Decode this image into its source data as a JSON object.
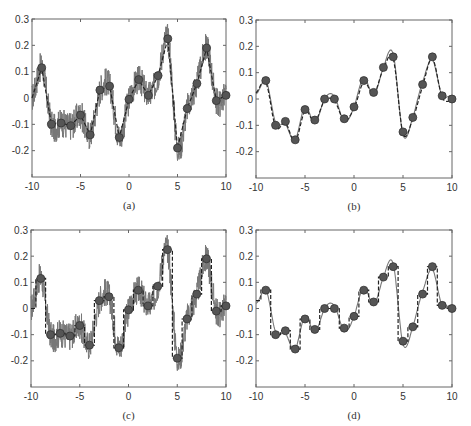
{
  "figure": {
    "captions": [
      "(a)",
      "(b)",
      "(c)",
      "(d)"
    ],
    "colors": {
      "axis": "#666666",
      "signal": "#777777",
      "dashed": "#222222",
      "marker_fill": "#555555",
      "marker_edge": "#333333",
      "text": "#333333"
    }
  },
  "chart_data": [
    {
      "id": "a",
      "type": "line",
      "caption": "(a)",
      "xlim": [
        -10,
        10
      ],
      "ylim": [
        -0.3,
        0.3
      ],
      "xticks": [
        -10,
        -5,
        0,
        5,
        10
      ],
      "yticks": [
        0.3,
        0.2,
        0.1,
        0,
        -0.1,
        -0.2
      ],
      "ytick_labels": [
        "0.3",
        "0.2",
        "0.1",
        "0",
        "-0.1",
        "-0.2"
      ],
      "xtick_labels": [
        "-10",
        "-5",
        "0",
        "5",
        "10"
      ],
      "grid": false,
      "series": [
        {
          "name": "noisy signal",
          "style": "solid gray, high-frequency noise"
        },
        {
          "name": "piecewise-linear interpolant",
          "style": "dashed black",
          "x": [
            -10,
            -9,
            -8,
            -7,
            -6,
            -5,
            -4,
            -3,
            -2,
            -1,
            0,
            1,
            2,
            3,
            4,
            5,
            6,
            7,
            8,
            9,
            10
          ],
          "y": [
            0.0,
            0.115,
            -0.1,
            -0.095,
            -0.105,
            -0.065,
            -0.14,
            0.03,
            0.045,
            -0.15,
            -0.005,
            0.07,
            0.01,
            0.085,
            0.225,
            -0.19,
            -0.04,
            0.055,
            0.19,
            -0.01,
            0.01
          ]
        },
        {
          "name": "samples",
          "style": "filled circles",
          "x": [
            -9,
            -8,
            -7,
            -6,
            -5,
            -4,
            -3,
            -2,
            -1,
            0,
            1,
            2,
            3,
            4,
            5,
            6,
            7,
            8,
            9,
            10
          ],
          "y": [
            0.115,
            -0.1,
            -0.095,
            -0.105,
            -0.065,
            -0.14,
            0.03,
            0.045,
            -0.15,
            -0.005,
            0.07,
            0.01,
            0.085,
            0.225,
            -0.19,
            -0.04,
            0.055,
            0.19,
            -0.01,
            0.01
          ]
        }
      ]
    },
    {
      "id": "b",
      "type": "line",
      "caption": "(b)",
      "xlim": [
        -10,
        10
      ],
      "ylim": [
        -0.3,
        0.3
      ],
      "xticks": [
        -10,
        -5,
        0,
        5,
        10
      ],
      "yticks": [
        0.3,
        0.2,
        0.1,
        0,
        -0.1,
        -0.2
      ],
      "ytick_labels": [
        "0.3",
        "0.2",
        "0.1",
        "0",
        "-0.1",
        "-0.2"
      ],
      "xtick_labels": [
        "-10",
        "-5",
        "0",
        "5",
        "10"
      ],
      "grid": false,
      "series": [
        {
          "name": "smooth signal",
          "style": "solid gray"
        },
        {
          "name": "smooth interpolant",
          "style": "dashed black"
        },
        {
          "name": "samples",
          "style": "filled circles",
          "x": [
            -9,
            -8,
            -7,
            -6,
            -5,
            -4,
            -3,
            -2,
            -1,
            0,
            1,
            2,
            3,
            4,
            5,
            6,
            7,
            8,
            9,
            10
          ],
          "y": [
            0.07,
            -0.1,
            -0.085,
            -0.155,
            -0.04,
            -0.08,
            0.0,
            0.0,
            -0.075,
            -0.03,
            0.07,
            0.025,
            0.12,
            0.16,
            -0.125,
            -0.07,
            0.055,
            0.16,
            0.012,
            0.0
          ]
        }
      ]
    },
    {
      "id": "c",
      "type": "line",
      "caption": "(c)",
      "xlim": [
        -10,
        10
      ],
      "ylim": [
        -0.3,
        0.3
      ],
      "xticks": [
        -10,
        -5,
        0,
        5,
        10
      ],
      "yticks": [
        0.3,
        0.2,
        0.1,
        0,
        -0.1,
        -0.2
      ],
      "ytick_labels": [
        "0.3",
        "0.2",
        "0.1",
        "0",
        "-0.1",
        "-0.2"
      ],
      "xtick_labels": [
        "-10",
        "-5",
        "0",
        "5",
        "10"
      ],
      "grid": false,
      "series": [
        {
          "name": "noisy signal",
          "style": "solid gray, high-frequency noise"
        },
        {
          "name": "step interpolant",
          "style": "dashed black, piecewise constant"
        },
        {
          "name": "samples",
          "style": "filled circles",
          "x": [
            -9,
            -8,
            -7,
            -6,
            -5,
            -4,
            -3,
            -2,
            -1,
            0,
            1,
            2,
            3,
            4,
            5,
            6,
            7,
            8,
            9,
            10
          ],
          "y": [
            0.115,
            -0.1,
            -0.095,
            -0.105,
            -0.065,
            -0.14,
            0.03,
            0.045,
            -0.15,
            -0.005,
            0.07,
            0.01,
            0.085,
            0.225,
            -0.19,
            -0.04,
            0.055,
            0.19,
            -0.01,
            0.01
          ]
        }
      ]
    },
    {
      "id": "d",
      "type": "line",
      "caption": "(d)",
      "xlim": [
        -10,
        10
      ],
      "ylim": [
        -0.3,
        0.3
      ],
      "xticks": [
        -10,
        -5,
        0,
        5,
        10
      ],
      "yticks": [
        0.3,
        0.2,
        0.1,
        0,
        -0.1,
        -0.2
      ],
      "ytick_labels": [
        "0.3",
        "0.2",
        "0.1",
        "0",
        "-0.1",
        "-0.2"
      ],
      "xtick_labels": [
        "-10",
        "-5",
        "0",
        "5",
        "10"
      ],
      "grid": false,
      "series": [
        {
          "name": "smooth signal",
          "style": "solid gray"
        },
        {
          "name": "step interpolant",
          "style": "dashed black, piecewise constant"
        },
        {
          "name": "samples",
          "style": "filled circles",
          "x": [
            -9,
            -8,
            -7,
            -6,
            -5,
            -4,
            -3,
            -2,
            -1,
            0,
            1,
            2,
            3,
            4,
            5,
            6,
            7,
            8,
            9,
            10
          ],
          "y": [
            0.07,
            -0.1,
            -0.085,
            -0.155,
            -0.04,
            -0.08,
            0.0,
            0.0,
            -0.075,
            -0.03,
            0.07,
            0.025,
            0.12,
            0.16,
            -0.125,
            -0.07,
            0.055,
            0.16,
            0.012,
            0.0
          ]
        }
      ]
    }
  ]
}
